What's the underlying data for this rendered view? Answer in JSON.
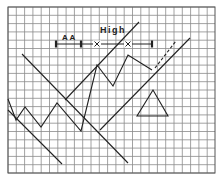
{
  "diagram": {
    "type": "technical-analysis-chart",
    "grid": {
      "x0": 8,
      "y0": 7,
      "x1": 215,
      "y1": 173,
      "cell": 8.3,
      "color": "#8a8a8a",
      "border_color": "#555555"
    },
    "labels": {
      "high": "High",
      "measure": "A A"
    },
    "measure_bar": {
      "y": 44,
      "ticks_x": [
        56,
        81,
        152
      ],
      "crosses_x": [
        97,
        128
      ]
    },
    "price_path": [
      [
        8,
        99
      ],
      [
        16,
        120
      ],
      [
        25,
        107
      ],
      [
        41,
        127
      ],
      [
        57,
        103
      ],
      [
        81,
        131
      ],
      [
        97,
        65
      ],
      [
        113,
        86
      ],
      [
        128,
        55
      ],
      [
        152,
        70
      ]
    ],
    "projection_dashed": [
      [
        155,
        68
      ],
      [
        176,
        41
      ]
    ],
    "trend_lines": [
      {
        "name": "long-descending-line",
        "from": [
          22,
          54
        ],
        "to": [
          128,
          163
        ]
      },
      {
        "name": "lower-left-descending-line",
        "from": [
          8,
          110
        ],
        "to": [
          62,
          164
        ]
      },
      {
        "name": "rising-trend-line",
        "from": [
          65,
          100
        ],
        "to": [
          139,
          22
        ]
      },
      {
        "name": "upper-channel-line",
        "from": [
          190,
          38
        ],
        "to": [
          100,
          130
        ]
      }
    ],
    "triangle": {
      "apex": [
        153,
        90
      ],
      "base_left": [
        137,
        116
      ],
      "base_right": [
        168,
        116
      ]
    },
    "line_color": "#222222"
  }
}
